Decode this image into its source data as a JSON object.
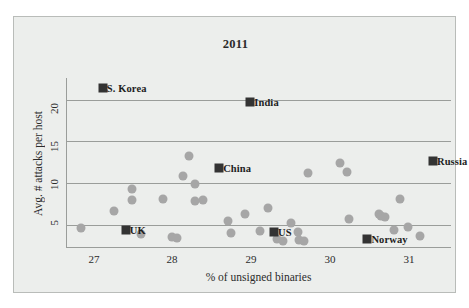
{
  "chart_data": {
    "type": "scatter",
    "title": "2011",
    "xlabel": "% of unsigned binaries",
    "ylabel": "Avg. # attacks per host",
    "xlim": [
      26.6,
      31.3
    ],
    "ylim": [
      2.2,
      22.6
    ],
    "xticks": [
      27,
      28,
      29,
      30,
      31
    ],
    "yticks": [
      5,
      10,
      15,
      20
    ],
    "grid": "horizontal",
    "legend": "none",
    "series": [
      {
        "name": "labeled-countries",
        "marker": "square",
        "color": "#333333",
        "points": [
          {
            "label": "S. Korea",
            "x": 27.05,
            "y": 21.4
          },
          {
            "label": "India",
            "x": 28.85,
            "y": 19.7
          },
          {
            "label": "China",
            "x": 28.47,
            "y": 11.8
          },
          {
            "label": "Russia",
            "x": 31.08,
            "y": 12.7
          },
          {
            "label": "UK",
            "x": 27.33,
            "y": 4.4
          },
          {
            "label": "US",
            "x": 29.14,
            "y": 4.1
          },
          {
            "label": "Norway",
            "x": 30.28,
            "y": 3.3
          }
        ]
      },
      {
        "name": "unlabeled-countries",
        "marker": "circle",
        "color": "#a6a6a6",
        "points": [
          {
            "x": 26.78,
            "y": 4.65
          },
          {
            "x": 27.18,
            "y": 6.7
          },
          {
            "x": 27.4,
            "y": 9.3
          },
          {
            "x": 27.4,
            "y": 7.95
          },
          {
            "x": 27.52,
            "y": 3.85
          },
          {
            "x": 27.78,
            "y": 8.1
          },
          {
            "x": 27.9,
            "y": 3.55
          },
          {
            "x": 27.95,
            "y": 3.45
          },
          {
            "x": 28.03,
            "y": 10.9
          },
          {
            "x": 28.1,
            "y": 13.2
          },
          {
            "x": 28.17,
            "y": 9.85
          },
          {
            "x": 28.17,
            "y": 7.8
          },
          {
            "x": 28.27,
            "y": 7.95
          },
          {
            "x": 28.58,
            "y": 5.5
          },
          {
            "x": 28.62,
            "y": 4.0
          },
          {
            "x": 28.78,
            "y": 6.3
          },
          {
            "x": 28.97,
            "y": 4.2
          },
          {
            "x": 29.07,
            "y": 7.0
          },
          {
            "x": 29.18,
            "y": 3.3
          },
          {
            "x": 29.25,
            "y": 3.0
          },
          {
            "x": 29.35,
            "y": 5.25
          },
          {
            "x": 29.43,
            "y": 4.15
          },
          {
            "x": 29.45,
            "y": 3.15
          },
          {
            "x": 29.5,
            "y": 3.05
          },
          {
            "x": 29.55,
            "y": 11.2
          },
          {
            "x": 29.95,
            "y": 12.4
          },
          {
            "x": 30.03,
            "y": 11.3
          },
          {
            "x": 30.05,
            "y": 5.7
          },
          {
            "x": 30.42,
            "y": 6.25
          },
          {
            "x": 30.45,
            "y": 6.0
          },
          {
            "x": 30.5,
            "y": 5.9
          },
          {
            "x": 30.6,
            "y": 4.35
          },
          {
            "x": 30.68,
            "y": 8.1
          },
          {
            "x": 30.78,
            "y": 4.75
          },
          {
            "x": 30.92,
            "y": 3.65
          }
        ]
      }
    ]
  },
  "axes": {
    "xticks": [
      "27",
      "28",
      "29",
      "30",
      "31"
    ],
    "yticks": [
      "20",
      "15",
      "10",
      "5"
    ]
  }
}
